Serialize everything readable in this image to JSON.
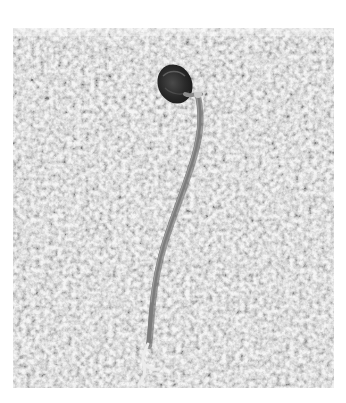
{
  "image": {
    "alt": "Grayscale photo of a sprouting seed with a long thin root lying on a gravel asphalt surface",
    "subject": "germinated seed with root",
    "background_surface": "aggregate asphalt / gravel",
    "color_mode": "grayscale",
    "colors": {
      "page_background": "#ffffff",
      "gravel_mid": "#a9a9a9",
      "gravel_light": "#e6e6e6",
      "gravel_dark": "#6e6e6e",
      "seed_dark": "#2a2a2a",
      "root": "#7a7a7a",
      "root_tip": "#e8e8e8"
    }
  }
}
